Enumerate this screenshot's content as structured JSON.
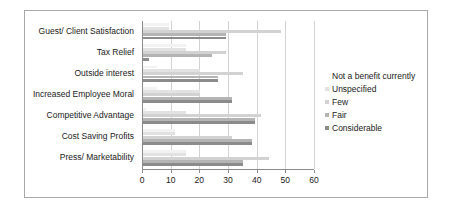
{
  "chart_data": {
    "type": "bar",
    "orientation": "horizontal",
    "title": "",
    "xlabel": "",
    "ylabel": "",
    "xlim": [
      0,
      60
    ],
    "xticks": [
      0,
      10,
      20,
      30,
      40,
      50,
      60
    ],
    "grid": true,
    "legend_position": "right",
    "categories": [
      "Guest/ Client Satisfaction",
      "Tax Relief",
      "Outside interest",
      "Increased Employee Moral",
      "Competitive Advantage",
      "Cost Saving Profits",
      "Press/ Marketability"
    ],
    "series": [
      {
        "name": "Not a benefit currently",
        "color": "#f2f2f2",
        "values": [
          9,
          15,
          5,
          5,
          1,
          11,
          15
        ]
      },
      {
        "name": "Unspecified",
        "color": "#e2e2e2",
        "values": [
          9,
          15,
          20,
          20,
          15,
          11,
          15
        ]
      },
      {
        "name": "Few",
        "color": "#d2d2d2",
        "values": [
          48,
          29,
          35,
          20,
          41,
          31,
          44
        ]
      },
      {
        "name": "Fair",
        "color": "#b4b4b4",
        "values": [
          29,
          24,
          26,
          31,
          39,
          38,
          35
        ]
      },
      {
        "name": "Considerable",
        "color": "#8b8b8b",
        "values": [
          29,
          2,
          26,
          31,
          39,
          38,
          35
        ]
      }
    ]
  },
  "legend": {
    "entries": [
      "Not a benefit currently",
      "Unspecified",
      "Few",
      "Fair",
      "Considerable"
    ]
  }
}
